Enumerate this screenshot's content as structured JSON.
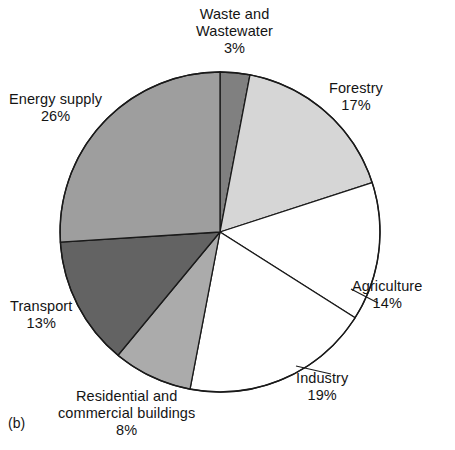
{
  "figure": {
    "caption": "(b)",
    "background_color": "#ffffff",
    "outline_color": "#1a1a1a"
  },
  "chart_data": {
    "type": "pie",
    "title": "",
    "xlabel": "",
    "ylabel": "",
    "legend_position": "none",
    "grid": false,
    "start_angle_deg": 0,
    "direction": "clockwise",
    "center": [
      220,
      232
    ],
    "radius": 160,
    "categories": [
      "Waste and Wastewater",
      "Forestry",
      "Agriculture",
      "Industry",
      "Residential and commercial buildings",
      "Transport",
      "Energy supply"
    ],
    "values": [
      3,
      17,
      14,
      19,
      8,
      13,
      26
    ],
    "value_unit": "%",
    "colors": [
      "#808080",
      "#d6d6d6",
      "#ffffff",
      "#ffffff",
      "#ababab",
      "#636363",
      "#9e9e9e"
    ],
    "slices": [
      {
        "label_line1": "Waste and",
        "label_line2": "Wastewater",
        "percent_text": "3%",
        "value": 3,
        "color": "#808080"
      },
      {
        "label_line1": "Forestry",
        "label_line2": "",
        "percent_text": "17%",
        "value": 17,
        "color": "#d6d6d6"
      },
      {
        "label_line1": "Agriculture",
        "label_line2": "",
        "percent_text": "14%",
        "value": 14,
        "color": "#ffffff"
      },
      {
        "label_line1": "Industry",
        "label_line2": "",
        "percent_text": "19%",
        "value": 19,
        "color": "#ffffff"
      },
      {
        "label_line1": "Residential and",
        "label_line2": "commercial buildings",
        "percent_text": "8%",
        "value": 8,
        "color": "#ababab"
      },
      {
        "label_line1": "Transport",
        "label_line2": "",
        "percent_text": "13%",
        "value": 13,
        "color": "#636363"
      },
      {
        "label_line1": "Energy supply",
        "label_line2": "",
        "percent_text": "26%",
        "value": 26,
        "color": "#9e9e9e"
      }
    ]
  }
}
